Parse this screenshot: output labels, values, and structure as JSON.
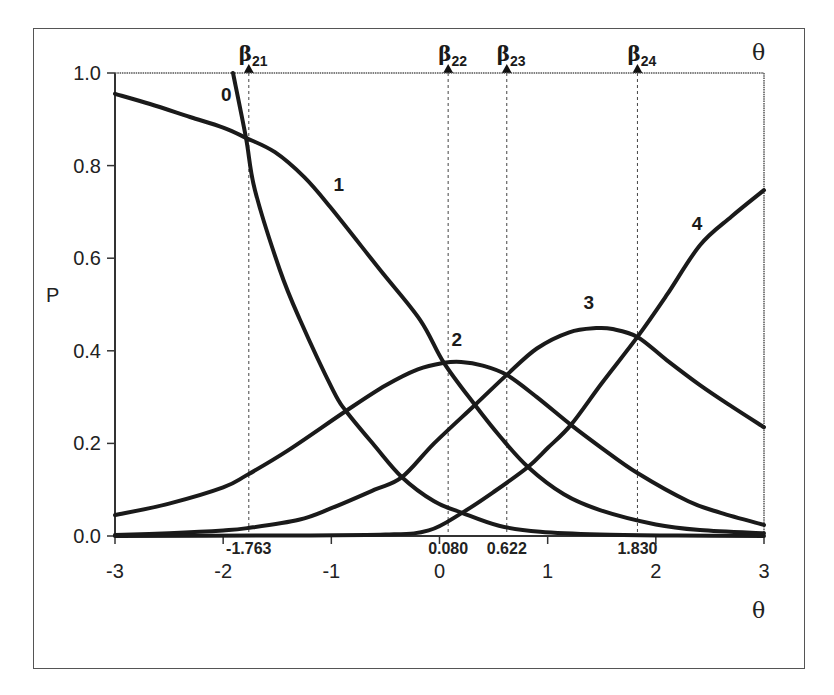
{
  "chart_data": {
    "type": "line",
    "title": "",
    "xlabel": "θ",
    "ylabel": "P",
    "top_axis_label": "θ",
    "xlim": [
      -3,
      3
    ],
    "ylim": [
      0,
      1
    ],
    "x_ticks": [
      -3,
      -2,
      -1,
      0,
      1,
      2,
      3
    ],
    "x_tick_labels": [
      "-3",
      "-2",
      "-1",
      "0",
      "1",
      "2",
      "3"
    ],
    "y_ticks": [
      0,
      0.2,
      0.4,
      0.6,
      0.8,
      1.0
    ],
    "y_tick_labels": [
      "0.0",
      "0.2",
      "0.4",
      "0.6",
      "0.8",
      "1.0"
    ],
    "grid": false,
    "legend": "none (curves labeled inline)",
    "thresholds": [
      {
        "name": "β21",
        "symbol": "β",
        "sub": "21",
        "value": -1.763,
        "label": "-1.763"
      },
      {
        "name": "β22",
        "symbol": "β",
        "sub": "22",
        "value": 0.08,
        "label": "0.080"
      },
      {
        "name": "β23",
        "symbol": "β",
        "sub": "23",
        "value": 0.622,
        "label": "0.622"
      },
      {
        "name": "β24",
        "symbol": "β",
        "sub": "24",
        "value": 1.83,
        "label": "1.830"
      }
    ],
    "series": [
      {
        "name": "0",
        "label_pos": [
          -1.97,
          0.94
        ],
        "points": [
          [
            -1.909,
            1.0
          ],
          [
            -1.789,
            0.86
          ],
          [
            -1.706,
            0.747
          ],
          [
            -1.475,
            0.574
          ],
          [
            -1.29,
            0.467
          ],
          [
            -0.985,
            0.315
          ],
          [
            -0.865,
            0.27
          ],
          [
            -0.6,
            0.195
          ],
          [
            -0.347,
            0.127
          ],
          [
            -0.05,
            0.075
          ],
          [
            0.208,
            0.05
          ],
          [
            0.55,
            0.022
          ],
          [
            0.93,
            0.009
          ],
          [
            1.48,
            0.003
          ],
          [
            2.2,
            0.001
          ],
          [
            3.0,
            0.0
          ]
        ]
      },
      {
        "name": "1",
        "label_pos": [
          -0.93,
          0.745
        ],
        "points": [
          [
            -3.0,
            0.955
          ],
          [
            -2.676,
            0.933
          ],
          [
            -2.307,
            0.905
          ],
          [
            -2.0,
            0.882
          ],
          [
            -1.789,
            0.86
          ],
          [
            -1.521,
            0.829
          ],
          [
            -1.25,
            0.775
          ],
          [
            -1.012,
            0.711
          ],
          [
            -0.55,
            0.575
          ],
          [
            -0.18,
            0.467
          ],
          [
            0.041,
            0.374
          ],
          [
            0.328,
            0.283
          ],
          [
            0.56,
            0.215
          ],
          [
            0.818,
            0.149
          ],
          [
            1.15,
            0.09
          ],
          [
            1.484,
            0.056
          ],
          [
            2.0,
            0.025
          ],
          [
            2.41,
            0.013
          ],
          [
            3.0,
            0.006
          ]
        ]
      },
      {
        "name": "2",
        "label_pos": [
          0.16,
          0.41
        ],
        "points": [
          [
            -3.0,
            0.045
          ],
          [
            -2.5,
            0.07
          ],
          [
            -2.0,
            0.105
          ],
          [
            -1.778,
            0.132
          ],
          [
            -1.4,
            0.185
          ],
          [
            -0.865,
            0.27
          ],
          [
            -0.5,
            0.325
          ],
          [
            -0.2,
            0.36
          ],
          [
            0.041,
            0.374
          ],
          [
            0.2,
            0.376
          ],
          [
            0.4,
            0.368
          ],
          [
            0.622,
            0.348
          ],
          [
            0.9,
            0.3
          ],
          [
            1.215,
            0.24
          ],
          [
            1.5,
            0.19
          ],
          [
            1.83,
            0.136
          ],
          [
            2.3,
            0.075
          ],
          [
            2.6,
            0.05
          ],
          [
            3.0,
            0.024
          ]
        ]
      },
      {
        "name": "3",
        "label_pos": [
          1.38,
          0.49
        ],
        "points": [
          [
            -3.0,
            0.002
          ],
          [
            -2.5,
            0.006
          ],
          [
            -2.0,
            0.012
          ],
          [
            -1.778,
            0.017
          ],
          [
            -1.3,
            0.035
          ],
          [
            -1.0,
            0.06
          ],
          [
            -0.6,
            0.1
          ],
          [
            -0.347,
            0.127
          ],
          [
            -0.05,
            0.2
          ],
          [
            0.328,
            0.283
          ],
          [
            0.622,
            0.348
          ],
          [
            0.9,
            0.405
          ],
          [
            1.2,
            0.44
          ],
          [
            1.45,
            0.449
          ],
          [
            1.6,
            0.447
          ],
          [
            1.83,
            0.43
          ],
          [
            2.1,
            0.38
          ],
          [
            2.408,
            0.326
          ],
          [
            2.7,
            0.28
          ],
          [
            3.0,
            0.235
          ]
        ]
      },
      {
        "name": "4",
        "label_pos": [
          2.38,
          0.66
        ],
        "points": [
          [
            -3.0,
            0.0
          ],
          [
            -1.5,
            0.001
          ],
          [
            -0.5,
            0.003
          ],
          [
            -0.1,
            0.012
          ],
          [
            0.208,
            0.05
          ],
          [
            0.5,
            0.095
          ],
          [
            0.818,
            0.149
          ],
          [
            1.0,
            0.19
          ],
          [
            1.215,
            0.24
          ],
          [
            1.5,
            0.33
          ],
          [
            1.83,
            0.43
          ],
          [
            2.1,
            0.52
          ],
          [
            2.408,
            0.628
          ],
          [
            2.7,
            0.69
          ],
          [
            3.0,
            0.747
          ]
        ]
      }
    ]
  }
}
